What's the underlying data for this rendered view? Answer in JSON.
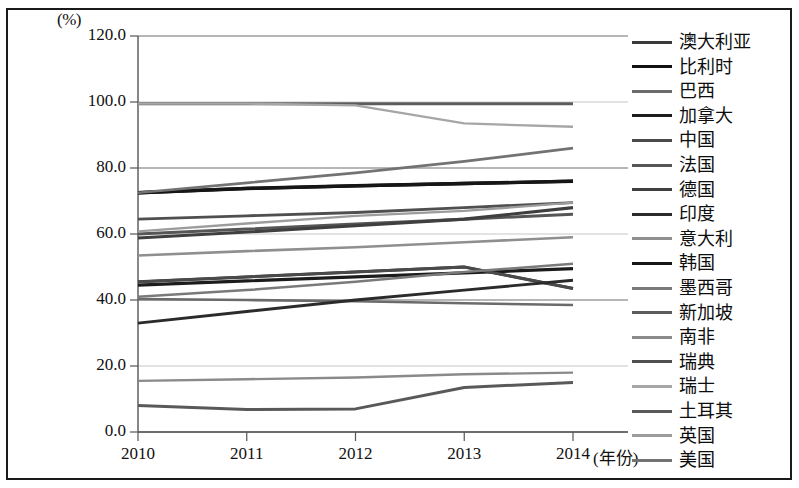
{
  "axes": {
    "unit_label": "(%)",
    "y_ticks": [
      "120.0",
      "100.0",
      "80.0",
      "60.0",
      "40.0",
      "20.0",
      "0.0"
    ],
    "y_values": [
      120,
      100,
      80,
      60,
      40,
      20,
      0
    ],
    "x_ticks": [
      "2010",
      "2011",
      "2012",
      "2013",
      "2014"
    ],
    "x_axis_title": "(年份)"
  },
  "chart_data": {
    "type": "line",
    "title": "",
    "subtitle": "",
    "xlabel": "(年份)",
    "ylabel": "(%)",
    "x": [
      "2010",
      "2011",
      "2012",
      "2013",
      "2014"
    ],
    "xlim": [
      2010,
      2014
    ],
    "ylim": [
      0,
      120
    ],
    "y_ticks": [
      0,
      20,
      40,
      60,
      80,
      100,
      120
    ],
    "grid": true,
    "legend_position": "right",
    "series": [
      {
        "name": "澳大利亚",
        "color": "#3a3a3a",
        "width": 3.0,
        "values": [
          45.5,
          47.0,
          48.5,
          50.0,
          43.5
        ]
      },
      {
        "name": "比利时",
        "color": "#111111",
        "width": 3.4,
        "values": [
          72.5,
          73.8,
          74.6,
          75.3,
          76.0
        ]
      },
      {
        "name": "巴西",
        "color": "#6b6b6b",
        "width": 2.6,
        "values": [
          40.3,
          40.0,
          39.6,
          39.0,
          38.5
        ]
      },
      {
        "name": "加拿大",
        "color": "#1c1c1c",
        "width": 3.2,
        "values": [
          44.5,
          45.8,
          47.0,
          48.2,
          49.5
        ]
      },
      {
        "name": "中国",
        "color": "#4a4a4a",
        "width": 2.8,
        "values": [
          45.5,
          47.0,
          48.5,
          50.0,
          43.5
        ]
      },
      {
        "name": "法国",
        "color": "#565656",
        "width": 3.0,
        "values": [
          60.0,
          61.5,
          63.0,
          64.5,
          66.0
        ]
      },
      {
        "name": "德国",
        "color": "#3f3f3f",
        "width": 3.1,
        "values": [
          58.8,
          60.6,
          62.5,
          64.5,
          68.0
        ]
      },
      {
        "name": "印度",
        "color": "#2b2b2b",
        "width": 2.9,
        "values": [
          33.0,
          36.5,
          40.0,
          43.0,
          46.0
        ]
      },
      {
        "name": "意大利",
        "color": "#8f8f8f",
        "width": 2.6,
        "values": [
          53.5,
          54.8,
          56.0,
          57.5,
          59.0
        ]
      },
      {
        "name": "韩国",
        "color": "#161616",
        "width": 3.3,
        "values": [
          72.5,
          73.8,
          74.6,
          75.3,
          76.0
        ]
      },
      {
        "name": "墨西哥",
        "color": "#7a7a7a",
        "width": 2.5,
        "values": [
          41.0,
          43.0,
          45.5,
          48.5,
          51.0
        ]
      },
      {
        "name": "新加坡",
        "color": "#5c5c5c",
        "width": 3.0,
        "values": [
          99.5,
          99.5,
          99.5,
          99.5,
          99.5
        ]
      },
      {
        "name": "南非",
        "color": "#8a8a8a",
        "width": 2.4,
        "values": [
          15.5,
          16.0,
          16.5,
          17.5,
          18.0
        ]
      },
      {
        "name": "瑞典",
        "color": "#4f4f4f",
        "width": 2.9,
        "values": [
          64.5,
          65.5,
          66.5,
          68.0,
          69.5
        ]
      },
      {
        "name": "瑞士",
        "color": "#a6a6a6",
        "width": 2.3,
        "values": [
          99.5,
          99.5,
          99.0,
          93.5,
          92.5
        ]
      },
      {
        "name": "土耳其",
        "color": "#595959",
        "width": 3.0,
        "values": [
          8.0,
          6.8,
          7.0,
          13.5,
          15.0
        ]
      },
      {
        "name": "英国",
        "color": "#9c9c9c",
        "width": 2.4,
        "values": [
          60.8,
          63.2,
          65.5,
          67.0,
          69.5
        ]
      },
      {
        "name": "美国",
        "color": "#737373",
        "width": 2.7,
        "values": [
          72.5,
          75.5,
          78.5,
          82.0,
          86.0
        ]
      }
    ]
  }
}
